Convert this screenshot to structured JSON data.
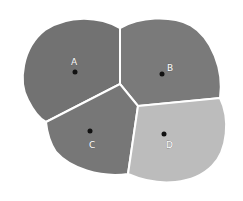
{
  "diagram": {
    "type": "voronoi",
    "regions": [
      {
        "id": "A",
        "label": "A",
        "color": "#727272",
        "site": [
          75,
          72
        ]
      },
      {
        "id": "B",
        "label": "B",
        "color": "#7a7a7a",
        "site": [
          162,
          74
        ]
      },
      {
        "id": "C",
        "label": "C",
        "color": "#777777",
        "site": [
          90,
          131
        ]
      },
      {
        "id": "D",
        "label": "D",
        "color": "#bcbcbc",
        "site": [
          164,
          134
        ]
      }
    ],
    "border_color": "#ffffff",
    "site_color": "#111111"
  }
}
